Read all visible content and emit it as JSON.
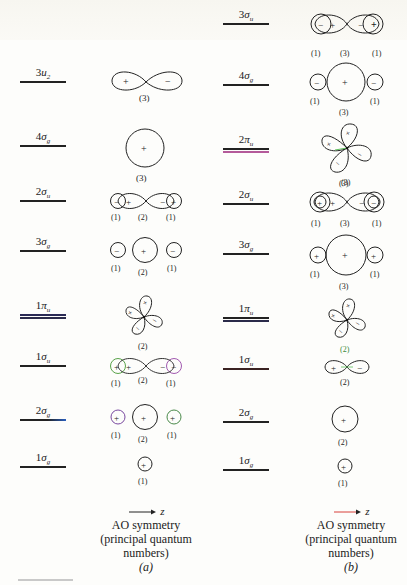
{
  "figure": {
    "panels": [
      {
        "id": "a",
        "panel_label": "(a)",
        "caption_lines": [
          "AO symmetry",
          "(principal quantum",
          "numbers)"
        ],
        "axis_label": "z",
        "arrow_color": "#222222",
        "levels": [
          {
            "num": "3",
            "sym": "u",
            "sub": "2",
            "raw": "3u2",
            "orbital": "p-figure-eight",
            "signs": [
              "+",
              "−"
            ],
            "qn": [
              "(3)"
            ]
          },
          {
            "num": "4",
            "sym": "σ",
            "sub": "g",
            "raw": "4σg",
            "orbital": "s-large",
            "signs": [
              "+"
            ],
            "qn": [
              "(3)"
            ]
          },
          {
            "num": "2",
            "sym": "σ",
            "sub": "u",
            "raw": "2σu",
            "orbital": "s-p-s",
            "signs": [
              "−",
              "+",
              "−",
              "+"
            ],
            "qn": [
              "(1)",
              "(2)",
              "(1)"
            ]
          },
          {
            "num": "3",
            "sym": "σ",
            "sub": "g",
            "raw": "3σg",
            "orbital": "s-s-s",
            "signs": [
              "−",
              "+",
              "−"
            ],
            "qn": [
              "(1)",
              "(2)",
              "(1)"
            ]
          },
          {
            "num": "1",
            "sym": "π",
            "sub": "u",
            "raw": "1πu",
            "orbital": "d-cloverleaf",
            "signs": [
              "+",
              "+",
              "−",
              "−"
            ],
            "qn": [
              "(2)"
            ]
          },
          {
            "num": "1",
            "sym": "σ",
            "sub": "u",
            "raw": "1σu",
            "orbital": "s-p-s",
            "signs": [
              "+",
              "+",
              "−",
              "−"
            ],
            "qn": [
              "(1)",
              "(2)",
              "(1)"
            ]
          },
          {
            "num": "2",
            "sym": "σ",
            "sub": "g",
            "raw": "2σg",
            "orbital": "s-s-s",
            "signs": [
              "+",
              "+",
              "+"
            ],
            "qn": [
              "(1)",
              "(2)",
              "(1)"
            ]
          },
          {
            "num": "1",
            "sym": "σ",
            "sub": "g",
            "raw": "1σg",
            "orbital": "s-small",
            "signs": [
              "+"
            ],
            "qn": [
              "(1)"
            ]
          }
        ]
      },
      {
        "id": "b",
        "panel_label": "(b)",
        "caption_lines": [
          "AO symmetry",
          "(principal quantum",
          "numbers)"
        ],
        "axis_label": "z",
        "arrow_color": "#d8413a",
        "levels": [
          {
            "num": "3",
            "sym": "σ",
            "sub": "u",
            "raw": "3σu",
            "orbital": "s-p-s",
            "signs": [
              "−",
              "+",
              "−",
              "+"
            ],
            "qn": [
              "(1)",
              "(3)",
              "(1)"
            ]
          },
          {
            "num": "4",
            "sym": "σ",
            "sub": "g",
            "raw": "4σg",
            "orbital": "s-s-s",
            "signs": [
              "−",
              "+",
              "−"
            ],
            "qn": [
              "(1)",
              "(3)",
              "(1)"
            ]
          },
          {
            "num": "2",
            "sym": "π",
            "sub": "u",
            "raw": "2πu",
            "orbital": "d-cloverleaf",
            "signs": [
              "+",
              "+",
              "−",
              "−"
            ],
            "qn": [
              "(3)"
            ]
          },
          {
            "num": "2",
            "sym": "σ",
            "sub": "u",
            "raw": "2σu",
            "orbital": "s-p-s",
            "signs": [
              "+",
              "+",
              "−",
              "−"
            ],
            "qn": [
              "(1)",
              "(3)",
              "(1)"
            ],
            "qn_top": "(3)"
          },
          {
            "num": "3",
            "sym": "σ",
            "sub": "g",
            "raw": "3σg",
            "orbital": "s-s-s",
            "signs": [
              "+",
              "+",
              "+"
            ],
            "qn": [
              "(1)",
              "(3)",
              "(1)"
            ]
          },
          {
            "num": "1",
            "sym": "π",
            "sub": "u",
            "raw": "1πu",
            "orbital": "d-cloverleaf",
            "signs": [
              "+",
              "+",
              "−",
              "−"
            ],
            "qn": [
              "(2)"
            ]
          },
          {
            "num": "1",
            "sym": "σ",
            "sub": "u",
            "raw": "1σu",
            "orbital": "p-figure-eight",
            "signs": [
              "+",
              "−"
            ],
            "qn": [
              "(2)"
            ],
            "qn_top": "(2)"
          },
          {
            "num": "2",
            "sym": "σ",
            "sub": "g",
            "raw": "2σg",
            "orbital": "s-large",
            "signs": [
              "+"
            ],
            "qn": [
              "(2)"
            ]
          },
          {
            "num": "1",
            "sym": "σ",
            "sub": "g",
            "raw": "1σg",
            "orbital": "s-small",
            "signs": [
              "+"
            ],
            "qn": [
              "(1)"
            ]
          }
        ]
      }
    ]
  }
}
